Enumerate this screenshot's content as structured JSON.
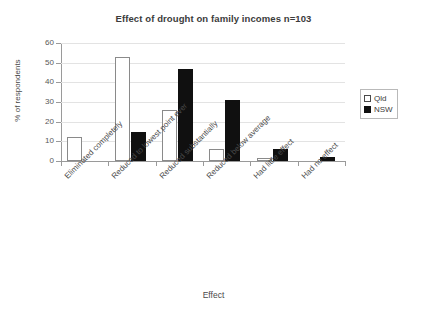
{
  "chart_data": {
    "type": "bar",
    "title": "Effect of drought on family incomes n=103",
    "xlabel": "Effect",
    "ylabel": "% of respondents",
    "ylim": [
      0,
      60
    ],
    "yticks": [
      0,
      10,
      20,
      30,
      40,
      50,
      60
    ],
    "grid": true,
    "legend_position": "right",
    "categories": [
      "Eliminated completely",
      "Reduced to lowest point ever",
      "Reduced substantially",
      "Reduced below average",
      "Had little effect",
      "Had no effect"
    ],
    "series": [
      {
        "name": "Qld",
        "color": "#ffffff",
        "edge_color": "#8a8a8a",
        "swatch": "open-square",
        "values": [
          12,
          53,
          26,
          6,
          1.5,
          0
        ]
      },
      {
        "name": "NSW",
        "color": "#101010",
        "edge_color": "#101010",
        "swatch": "filled-square",
        "values": [
          0,
          15,
          47,
          31,
          6,
          2
        ]
      }
    ]
  },
  "legend": {
    "items": [
      {
        "label": "Qld"
      },
      {
        "label": "NSW"
      }
    ]
  },
  "colors": {
    "qld_fill": "#ffffff",
    "qld_edge": "#8a8a8a",
    "nsw_fill": "#101010",
    "axis": "#9a9a9a",
    "gridline": "#e3e3e3",
    "text": "#4a4a4a"
  }
}
